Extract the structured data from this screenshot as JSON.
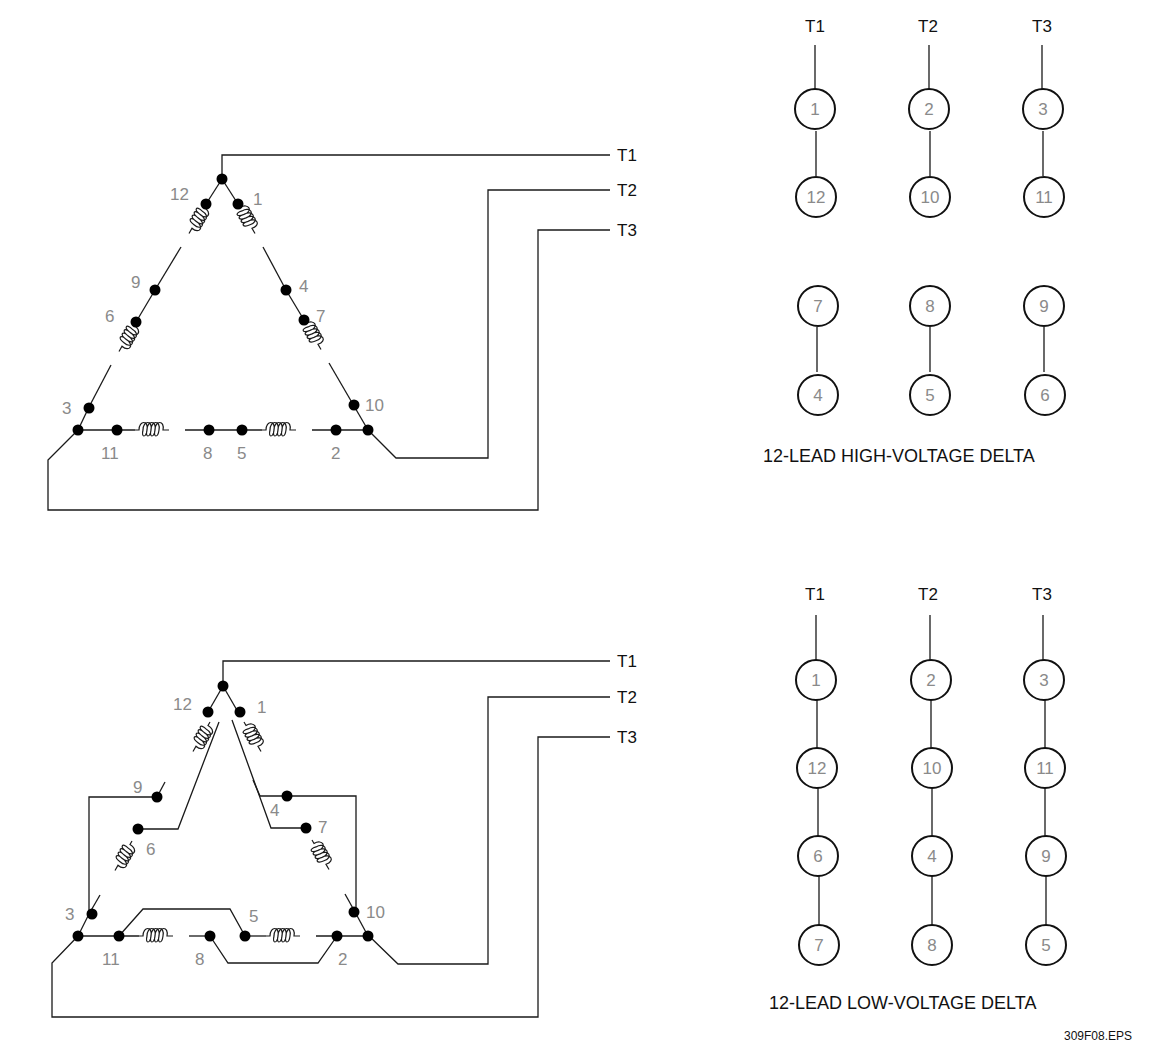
{
  "figure": {
    "file_label": "309F08.EPS",
    "caption_partial": ""
  },
  "high_voltage": {
    "title": "12-LEAD HIGH-VOLTAGE DELTA",
    "terminal_labels": [
      "T1",
      "T2",
      "T3"
    ],
    "table": {
      "columns": [
        "T1",
        "T2",
        "T3"
      ],
      "groups": [
        [
          [
            "1",
            "12"
          ],
          [
            "2",
            "10"
          ],
          [
            "3",
            "11"
          ]
        ],
        [
          [
            "7",
            "4"
          ],
          [
            "8",
            "5"
          ],
          [
            "9",
            "6"
          ]
        ]
      ]
    },
    "leads": {
      "l12": "12",
      "l1": "1",
      "l9": "9",
      "l4": "4",
      "l6": "6",
      "l7": "7",
      "l3": "3",
      "l10": "10",
      "l11": "11",
      "l8": "8",
      "l5": "5",
      "l2": "2"
    }
  },
  "low_voltage": {
    "title": "12-LEAD LOW-VOLTAGE DELTA",
    "terminal_labels": [
      "T1",
      "T2",
      "T3"
    ],
    "table": {
      "columns": [
        "T1",
        "T2",
        "T3"
      ],
      "rows": [
        [
          "1",
          "2",
          "3"
        ],
        [
          "12",
          "10",
          "11"
        ],
        [
          "6",
          "4",
          "9"
        ],
        [
          "7",
          "8",
          "5"
        ]
      ]
    },
    "leads": {
      "l12": "12",
      "l1": "1",
      "l9": "9",
      "l4": "4",
      "l6": "6",
      "l7": "7",
      "l3": "3",
      "l10": "10",
      "l11": "11",
      "l8": "8",
      "l5": "5",
      "l2": "2"
    }
  }
}
